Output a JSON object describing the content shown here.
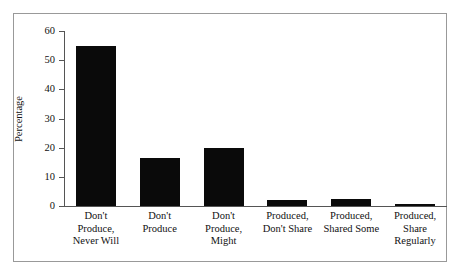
{
  "chart_data": {
    "type": "bar",
    "title": "",
    "subtitle": "",
    "xlabel": "",
    "ylabel": "Percentage",
    "ylim": [
      0,
      60
    ],
    "yticks": [
      0,
      10,
      20,
      30,
      40,
      50,
      60
    ],
    "ytick_labels": [
      "0",
      "10",
      "20",
      "30",
      "40",
      "50",
      "60"
    ],
    "grid": false,
    "legend": false,
    "legend_position": "none",
    "bar_color": "#0a0a0a",
    "categories": [
      "Don't Produce, Never Will",
      "Don't Produce",
      "Don't Produce, Might",
      "Produced, Don't Share",
      "Produced, Shared Some",
      "Produced, Share Regularly"
    ],
    "category_lines": [
      [
        "Don't",
        "Produce,",
        "Never Will"
      ],
      [
        "Don't",
        "Produce"
      ],
      [
        "Don't",
        "Produce,",
        "Might"
      ],
      [
        "Produced,",
        "Don't Share"
      ],
      [
        "Produced,",
        "Shared Some"
      ],
      [
        "Produced,",
        "Share",
        "Regularly"
      ]
    ],
    "values": [
      55,
      16.5,
      20,
      2,
      2.5,
      0.7
    ]
  },
  "figure": {
    "frame_color": "#999999",
    "background": "#ffffff",
    "axis_color": "#555555"
  }
}
